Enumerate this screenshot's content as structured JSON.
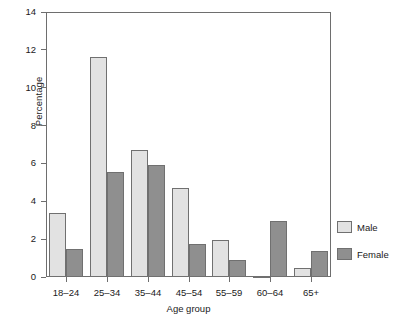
{
  "chart_data": {
    "type": "bar",
    "title": "",
    "xlabel": "Age group",
    "ylabel": "Percentage",
    "categories": [
      "18–24",
      "25–34",
      "35–44",
      "45–54",
      "55–59",
      "60–64",
      "65+"
    ],
    "series": [
      {
        "name": "Male",
        "color": "#e2e2e2",
        "values": [
          3.4,
          11.6,
          6.7,
          4.7,
          1.95,
          0.05,
          0.45
        ]
      },
      {
        "name": "Female",
        "color": "#8f8f8f",
        "values": [
          1.5,
          5.55,
          5.9,
          1.75,
          0.9,
          2.95,
          1.4
        ]
      }
    ],
    "ylim": [
      0,
      14
    ],
    "yticks": [
      0,
      2,
      4,
      6,
      8,
      10,
      12,
      14
    ],
    "ytick_labels": [
      "0",
      "2",
      "4",
      "6",
      "8",
      "10",
      "12",
      "14"
    ],
    "grid": false,
    "legend_position": "right",
    "legend_entries": [
      "Male",
      "Female"
    ]
  }
}
